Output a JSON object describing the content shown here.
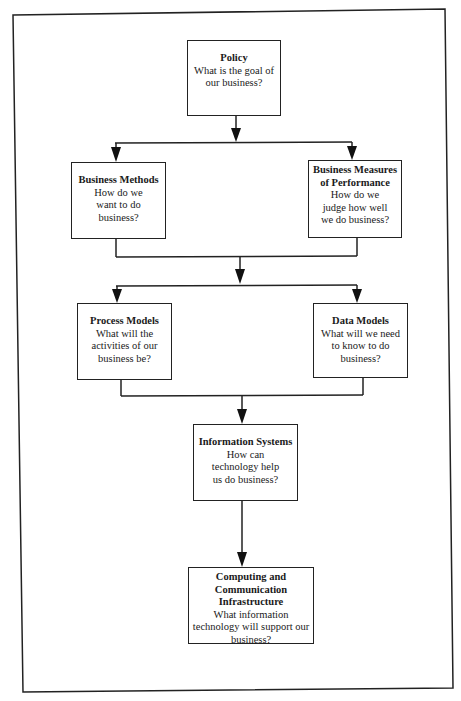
{
  "diagram": {
    "type": "hierarchical-flowchart",
    "nodes": [
      {
        "id": "policy",
        "title": "Policy",
        "question": "What is the goal of our business?"
      },
      {
        "id": "business-methods",
        "title": "Business Methods",
        "question": "How do we want to do business?"
      },
      {
        "id": "business-measures",
        "title": "Business Measures of Performance",
        "question": "How do we judge how well we do business?"
      },
      {
        "id": "process-models",
        "title": "Process Models",
        "question": "What will the activities of our business be?"
      },
      {
        "id": "data-models",
        "title": "Data Models",
        "question": "What will we need to know to do business?"
      },
      {
        "id": "information-systems",
        "title": "Information Systems",
        "question": "How can technology help us do business?"
      },
      {
        "id": "computing-infrastructure",
        "title": "Computing and Communication Infrastructure",
        "question": "What information technology will support our business?"
      }
    ],
    "edges": [
      {
        "from": "policy",
        "to": "business-methods"
      },
      {
        "from": "policy",
        "to": "business-measures"
      },
      {
        "from": "business-methods",
        "to": "process-models"
      },
      {
        "from": "business-methods",
        "to": "data-models"
      },
      {
        "from": "business-measures",
        "to": "process-models"
      },
      {
        "from": "business-measures",
        "to": "data-models"
      },
      {
        "from": "process-models",
        "to": "information-systems"
      },
      {
        "from": "data-models",
        "to": "information-systems"
      },
      {
        "from": "information-systems",
        "to": "computing-infrastructure"
      }
    ],
    "colors": {
      "line": "#222222",
      "background": "#ffffff"
    }
  }
}
